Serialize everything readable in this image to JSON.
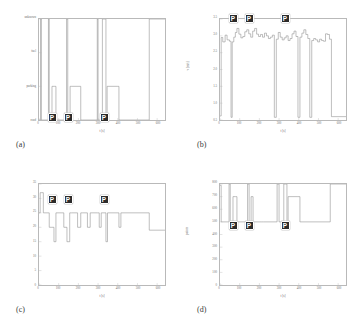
{
  "figure": {
    "background_color": "#ffffff",
    "line_color": "#8a8a8a",
    "axis_color": "#b9b9b9",
    "marker_color": "#2b2b2b",
    "marker_text_color": "#ffffff",
    "marker_label": "P"
  },
  "panels": [
    {
      "id": "a",
      "caption": "(a)",
      "xlabel": "t [s]",
      "ylabel": "",
      "xticks": [
        "0",
        "100",
        "200",
        "300",
        "400",
        "500",
        "600"
      ],
      "yticks": [
        "road",
        "parking",
        "fuel",
        "unknown"
      ],
      "parking_markers": [
        "P",
        "P",
        "P"
      ]
    },
    {
      "id": "b",
      "caption": "(b)",
      "xlabel": "t [s]",
      "ylabel": "v [m/s]",
      "xticks": [
        "0",
        "100",
        "200",
        "300",
        "400",
        "500",
        "600"
      ],
      "yticks": [
        "0.5",
        "1.0",
        "1.5",
        "2.0",
        "2.5",
        "3.0",
        "3.5"
      ],
      "parking_markers": [
        "P",
        "P",
        "P"
      ]
    },
    {
      "id": "c",
      "caption": "(c)",
      "xlabel": "t [s]",
      "ylabel": "",
      "xticks": [
        "0",
        "100",
        "200",
        "300",
        "400",
        "500",
        "600"
      ],
      "yticks": [
        "0",
        "5",
        "10",
        "15",
        "20",
        "25",
        "30",
        "35"
      ],
      "parking_markers": [
        "P",
        "P",
        "P"
      ]
    },
    {
      "id": "d",
      "caption": "(d)",
      "xlabel": "t [s]",
      "ylabel": "points",
      "xticks": [
        "0",
        "100",
        "200",
        "300",
        "400",
        "500",
        "600"
      ],
      "yticks": [
        "0",
        "100",
        "200",
        "300",
        "400",
        "500",
        "600",
        "700",
        "800"
      ],
      "parking_markers": [
        "P",
        "P",
        "P"
      ]
    }
  ],
  "chart_data": [
    {
      "type": "line",
      "id": "a",
      "title": "",
      "xlabel": "t [s]",
      "ylabel": "",
      "xlim": [
        0,
        640
      ],
      "ylim": [
        0,
        3
      ],
      "grid": false,
      "categorical_y": [
        "road",
        "parking",
        "fuel",
        "unknown"
      ],
      "y_tick_values": [
        0,
        1,
        2,
        3
      ],
      "series": [
        {
          "name": "context state",
          "step": "post",
          "x": [
            0,
            8,
            12,
            48,
            52,
            66,
            78,
            86,
            140,
            146,
            158,
            166,
            212,
            220,
            296,
            300,
            316,
            322,
            340,
            346,
            400,
            406,
            560,
            640
          ],
          "y": [
            0,
            3,
            0,
            3,
            0,
            1,
            1,
            0,
            3,
            0,
            1,
            1,
            0,
            0,
            3,
            0,
            0,
            3,
            0,
            1,
            1,
            0,
            3,
            3
          ]
        }
      ],
      "parking_markers_x": [
        70,
        150,
        330
      ]
    },
    {
      "type": "line",
      "id": "b",
      "title": "",
      "xlabel": "t [s]",
      "ylabel": "v [m/s]",
      "xlim": [
        0,
        640
      ],
      "ylim": [
        0.5,
        3.5
      ],
      "grid": false,
      "y_tick_values": [
        0.5,
        1.0,
        1.5,
        2.0,
        2.5,
        3.0,
        3.5
      ],
      "series": [
        {
          "name": "speed",
          "step": "post",
          "x": [
            0,
            6,
            14,
            26,
            36,
            48,
            56,
            62,
            70,
            78,
            86,
            96,
            106,
            116,
            126,
            136,
            146,
            156,
            166,
            176,
            186,
            196,
            206,
            216,
            226,
            236,
            246,
            256,
            266,
            276,
            286,
            296,
            306,
            316,
            326,
            336,
            346,
            356,
            366,
            376,
            386,
            396,
            406,
            416,
            426,
            436,
            446,
            456,
            466,
            476,
            486,
            496,
            506,
            516,
            526,
            536,
            546,
            556,
            566,
            640
          ],
          "y": [
            0.62,
            2.95,
            2.82,
            3.02,
            2.88,
            2.84,
            0.58,
            2.82,
            2.96,
            3.1,
            3.22,
            3.05,
            2.94,
            2.98,
            3.12,
            3.18,
            3.06,
            2.96,
            3.14,
            3.22,
            3.05,
            2.98,
            3.04,
            2.96,
            3.08,
            3.0,
            2.92,
            2.96,
            3.02,
            0.58,
            2.9,
            3.1,
            2.96,
            2.88,
            2.94,
            3.0,
            2.86,
            2.92,
            3.06,
            3.14,
            2.98,
            0.58,
            2.96,
            3.08,
            3.18,
            3.04,
            2.92,
            0.58,
            2.86,
            2.92,
            2.88,
            2.82,
            2.9,
            2.86,
            2.84,
            3.06,
            3.04,
            2.9,
            0.6,
            0.6
          ]
        }
      ],
      "parking_markers_x": [
        70,
        150,
        330
      ]
    },
    {
      "type": "line",
      "id": "c",
      "title": "",
      "xlabel": "t [s]",
      "ylabel": "",
      "xlim": [
        0,
        640
      ],
      "ylim": [
        0,
        35
      ],
      "grid": false,
      "y_tick_values": [
        0,
        5,
        10,
        15,
        20,
        25,
        30,
        35
      ],
      "series": [
        {
          "name": "count",
          "step": "post",
          "x": [
            0,
            6,
            14,
            22,
            46,
            52,
            66,
            76,
            86,
            112,
            126,
            142,
            156,
            166,
            196,
            212,
            222,
            246,
            260,
            296,
            306,
            316,
            330,
            340,
            348,
            396,
            406,
            416,
            560,
            640
          ],
          "y": [
            25,
            32,
            32,
            25,
            25,
            20,
            20,
            15,
            25,
            25,
            20,
            15,
            25,
            25,
            20,
            25,
            25,
            20,
            25,
            25,
            20,
            25,
            25,
            15,
            25,
            25,
            20,
            25,
            19,
            19
          ]
        }
      ],
      "parking_markers_x": [
        70,
        150,
        330
      ]
    },
    {
      "type": "line",
      "id": "d",
      "title": "",
      "xlabel": "t [s]",
      "ylabel": "points",
      "xlim": [
        0,
        640
      ],
      "ylim": [
        0,
        800
      ],
      "grid": false,
      "y_tick_values": [
        0,
        100,
        200,
        300,
        400,
        500,
        600,
        700,
        800
      ],
      "series": [
        {
          "name": "points",
          "step": "post",
          "x": [
            0,
            6,
            12,
            46,
            52,
            66,
            78,
            86,
            140,
            148,
            158,
            168,
            212,
            220,
            290,
            300,
            316,
            324,
            340,
            346,
            396,
            406,
            560,
            640
          ],
          "y": [
            790,
            500,
            500,
            800,
            500,
            700,
            700,
            500,
            800,
            500,
            700,
            500,
            500,
            500,
            800,
            500,
            500,
            800,
            500,
            700,
            700,
            500,
            800,
            800
          ]
        }
      ],
      "parking_markers_x": [
        70,
        150,
        330
      ]
    }
  ]
}
